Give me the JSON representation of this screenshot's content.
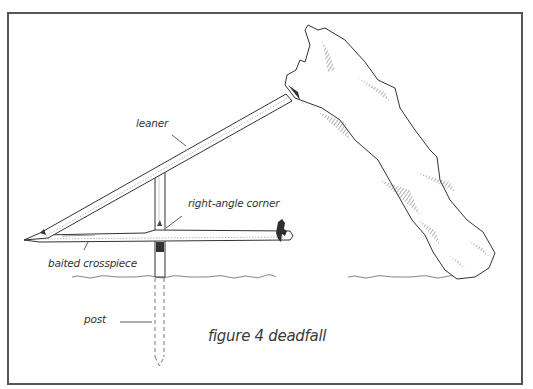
{
  "figure": {
    "caption": "figure 4 deadfall",
    "labels": {
      "leaner": "leaner",
      "right_angle_corner": "right-angle corner",
      "baited_crosspiece": "baited crosspiece",
      "post": "post"
    },
    "colors": {
      "ink": "#333333",
      "frame": "#555555",
      "background": "#ffffff",
      "hatch": "#666666"
    }
  }
}
